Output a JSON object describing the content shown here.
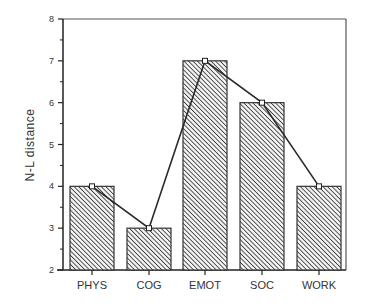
{
  "chart_data": {
    "type": "bar",
    "title": "",
    "xlabel": "",
    "ylabel": "N-L  distance",
    "categories": [
      "PHYS",
      "COG",
      "EMOT",
      "SOC",
      "WORK"
    ],
    "values": [
      4,
      3,
      7,
      6,
      4
    ],
    "series": [
      {
        "name": "bars",
        "type": "bar",
        "values": [
          4,
          3,
          7,
          6,
          4
        ]
      },
      {
        "name": "line",
        "type": "line",
        "values": [
          4,
          3,
          7,
          6,
          4
        ]
      }
    ],
    "ylim": [
      2,
      8
    ],
    "yticks": [
      2,
      3,
      4,
      5,
      6,
      7,
      8
    ],
    "grid": false,
    "legend": "none",
    "bar_fill": "diagonal-hatch",
    "colors": {
      "bar_stroke": "#333333",
      "hatch": "#3a3a3a",
      "line": "#2a2a2a",
      "marker_fill": "#ffffff"
    }
  }
}
